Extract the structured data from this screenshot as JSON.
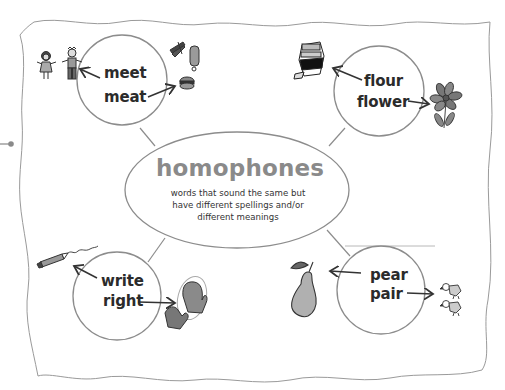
{
  "diagram": {
    "title": "homophones",
    "definition": {
      "line1": "words that sound the same but",
      "line2": "have different spellings and/or",
      "line3": "different meanings"
    },
    "nodes": [
      {
        "position": "top-left",
        "word1": "meet",
        "word1_picture": "two children (people meeting)",
        "word2": "meat",
        "word2_picture": "bacon, drumstick and hamburger"
      },
      {
        "position": "top-right",
        "word1": "flour",
        "word1_picture": "bag of flour",
        "word2": "flower",
        "word2_picture": "flower"
      },
      {
        "position": "bottom-left",
        "word1": "write",
        "word1_picture": "crayon scribbling",
        "word2": "right",
        "word2_picture": "right mitten circled"
      },
      {
        "position": "bottom-right",
        "word1": "pear",
        "word1_picture": "pear fruit",
        "word2": "pair",
        "word2_picture": "two birds"
      }
    ],
    "colors": {
      "outline": "#8c8c8c",
      "title": "#8a8a8a",
      "text": "#2b2b2b"
    }
  }
}
